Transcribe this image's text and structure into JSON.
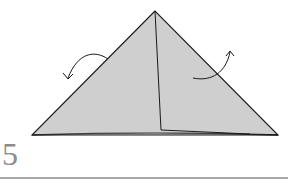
{
  "step": {
    "number": "5"
  },
  "diagram": {
    "paper_color": "#cfcfcf",
    "line_color": "#1a1a1a",
    "rule_color": "#a8a8a8",
    "step_number_color": "#8c8c8c",
    "shapes": {
      "triangle": {
        "apex": [
          155,
          11
        ],
        "base_left": [
          32,
          135
        ],
        "base_right": [
          278,
          135
        ]
      },
      "inner_crease": [
        [
          155,
          11
        ],
        [
          161,
          130
        ],
        [
          250,
          134
        ]
      ]
    },
    "arrows": [
      {
        "name": "fold-back-left-arrow",
        "direction": "left-down"
      },
      {
        "name": "fold-back-right-arrow",
        "direction": "right-up"
      }
    ]
  }
}
